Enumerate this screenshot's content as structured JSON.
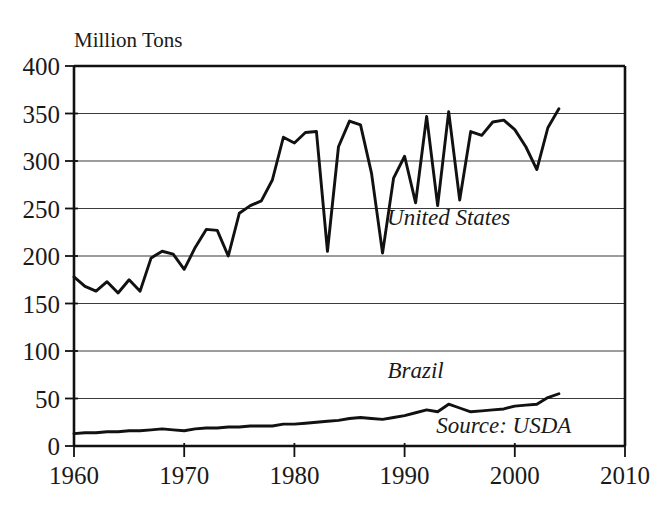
{
  "chart_data": {
    "type": "line",
    "title": "",
    "ylabel": "Million Tons",
    "xlabel": "",
    "xlim": [
      1960,
      2010
    ],
    "ylim": [
      0,
      400
    ],
    "grid": true,
    "legend_position": "inline-annotations",
    "xticks": [
      "1960",
      "1970",
      "1980",
      "1990",
      "2000",
      "2010"
    ],
    "xtick_values": [
      1960,
      1970,
      1980,
      1990,
      2000,
      2010
    ],
    "yticks": [
      "0",
      "50",
      "100",
      "150",
      "200",
      "250",
      "300",
      "350",
      "400"
    ],
    "ytick_values": [
      0,
      50,
      100,
      150,
      200,
      250,
      300,
      350,
      400
    ],
    "annotations": [
      {
        "text": "United States",
        "x": 1994,
        "y": 233
      },
      {
        "text": "Brazil",
        "x": 1991,
        "y": 72
      },
      {
        "text": "Source: USDA",
        "x": 1999,
        "y": 14
      }
    ],
    "x": [
      1960,
      1961,
      1962,
      1963,
      1964,
      1965,
      1966,
      1967,
      1968,
      1969,
      1970,
      1971,
      1972,
      1973,
      1974,
      1975,
      1976,
      1977,
      1978,
      1979,
      1980,
      1981,
      1982,
      1983,
      1984,
      1985,
      1986,
      1987,
      1988,
      1989,
      1990,
      1991,
      1992,
      1993,
      1994,
      1995,
      1996,
      1997,
      1998,
      1999,
      2000,
      2001,
      2002,
      2003,
      2004
    ],
    "series": [
      {
        "name": "United States",
        "values": [
          178,
          168,
          163,
          173,
          161,
          175,
          163,
          198,
          205,
          202,
          186,
          209,
          228,
          227,
          200,
          245,
          253,
          258,
          280,
          325,
          319,
          330,
          331,
          205,
          315,
          342,
          338,
          287,
          203,
          282,
          305,
          256,
          347,
          253,
          352,
          259,
          331,
          327,
          341,
          343,
          333,
          315,
          291,
          335,
          355
        ]
      },
      {
        "name": "Brazil",
        "values": [
          13,
          14,
          14,
          15,
          15,
          16,
          16,
          17,
          18,
          17,
          16,
          18,
          19,
          19,
          20,
          20,
          21,
          21,
          21,
          23,
          23,
          24,
          25,
          26,
          27,
          29,
          30,
          29,
          28,
          30,
          32,
          35,
          38,
          36,
          44,
          40,
          36,
          37,
          38,
          39,
          42,
          43,
          44,
          51,
          55
        ]
      }
    ]
  },
  "figure": {
    "series_label_us": "United States",
    "series_label_brazil": "Brazil",
    "source_text": "Source: USDA",
    "y_axis_title": "Million Tons"
  },
  "colors": {
    "line": "#111111",
    "grid": "#3a3a3a",
    "frame": "#111111",
    "background": "#ffffff",
    "text": "#1a1a1a"
  }
}
